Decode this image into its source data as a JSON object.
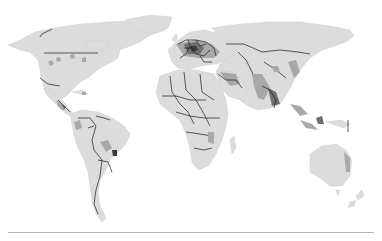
{
  "map": {
    "type": "choropleth",
    "projection": "world",
    "colors": {
      "background": "#ffffff",
      "land_base": "#dcdcdc",
      "level_mid": "#a8a8a8",
      "level_dark": "#6e6e6e",
      "level_very_dark": "#3a3a3a",
      "borders": "#1a1a1a",
      "divider": "#b5b5b5"
    },
    "regions": [
      {
        "name": "north-america",
        "shade": "light"
      },
      {
        "name": "central-america",
        "shade": "mixed"
      },
      {
        "name": "south-america",
        "shade": "light-with-dark-spots"
      },
      {
        "name": "europe",
        "shade": "dark"
      },
      {
        "name": "africa",
        "shade": "light"
      },
      {
        "name": "middle-east",
        "shade": "mid"
      },
      {
        "name": "russia",
        "shade": "light"
      },
      {
        "name": "india",
        "shade": "mid"
      },
      {
        "name": "china",
        "shade": "light-with-mid-spots"
      },
      {
        "name": "southeast-asia",
        "shade": "dark"
      },
      {
        "name": "australia",
        "shade": "light"
      },
      {
        "name": "new-zealand",
        "shade": "light"
      },
      {
        "name": "greenland",
        "shade": "light"
      },
      {
        "name": "madagascar",
        "shade": "light"
      }
    ]
  }
}
